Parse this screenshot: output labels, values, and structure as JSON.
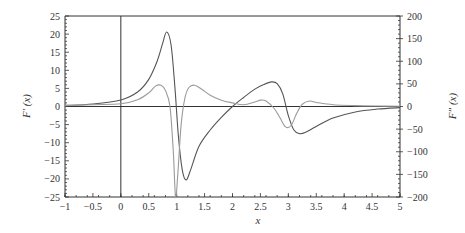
{
  "chart_data": {
    "type": "line",
    "title": "",
    "xlabel": "x",
    "ylabel_left": "F'(x)",
    "ylabel_right": "F''(x)",
    "xlim": [
      -1,
      5
    ],
    "ylim_left": [
      -25,
      25
    ],
    "ylim_right": [
      -200,
      200
    ],
    "grid": false,
    "legend": null,
    "x_ticks": [
      "-1",
      "-0.5",
      "0",
      "0.5",
      "1",
      "1.5",
      "2",
      "2.5",
      "3",
      "3.5",
      "4",
      "4.5",
      "5"
    ],
    "y_ticks_left": [
      "25",
      "20",
      "15",
      "10",
      "5",
      "0",
      "-5",
      "-10",
      "-15",
      "-20",
      "-25"
    ],
    "y_ticks_right": [
      "200",
      "150",
      "100",
      "50",
      "0",
      "-50",
      "-100",
      "-150",
      "-200"
    ],
    "series": [
      {
        "name": "F'(x)",
        "axis": "left",
        "color": "#555555",
        "x": [
          -1,
          -0.5,
          0,
          0.3,
          0.5,
          0.65,
          0.75,
          0.82,
          0.9,
          0.97,
          1.03,
          1.1,
          1.17,
          1.25,
          1.4,
          1.6,
          1.8,
          2.0,
          2.2,
          2.4,
          2.55,
          2.7,
          2.8,
          2.9,
          3.0,
          3.1,
          3.2,
          3.3,
          3.5,
          3.8,
          4.2,
          4.6,
          5.0
        ],
        "y": [
          0.3,
          0.7,
          1.8,
          4.0,
          7.5,
          12.5,
          17.5,
          20.6,
          17.0,
          5.0,
          -8.0,
          -17.5,
          -20.3,
          -17.5,
          -11.0,
          -6.5,
          -3.0,
          0.0,
          2.5,
          4.8,
          6.0,
          6.8,
          6.3,
          3.5,
          -2.5,
          -6.5,
          -7.5,
          -7.2,
          -5.5,
          -3.2,
          -1.5,
          -0.7,
          -0.3
        ]
      },
      {
        "name": "F''(x)",
        "axis": "right",
        "color": "#9a9a9a",
        "x": [
          -1,
          -0.5,
          0,
          0.3,
          0.5,
          0.62,
          0.72,
          0.8,
          0.88,
          0.94,
          0.98,
          1.02,
          1.08,
          1.15,
          1.22,
          1.32,
          1.45,
          1.6,
          1.8,
          2.0,
          2.2,
          2.4,
          2.5,
          2.6,
          2.75,
          2.85,
          2.95,
          3.05,
          3.15,
          3.25,
          3.38,
          3.5,
          3.8,
          4.2,
          4.6,
          5.0
        ],
        "y": [
          2,
          4,
          6,
          15,
          30,
          45,
          47,
          35,
          0,
          -100,
          -200,
          -150,
          -40,
          20,
          42,
          47,
          38,
          25,
          14,
          8,
          4,
          10,
          14,
          12,
          -5,
          -25,
          -45,
          -42,
          -15,
          5,
          12,
          9,
          4,
          2,
          1,
          0.5
        ]
      }
    ]
  },
  "axes": {
    "xlabel": "x",
    "ylabel_left": "F′ (x)",
    "ylabel_right": "F″ (x)"
  }
}
